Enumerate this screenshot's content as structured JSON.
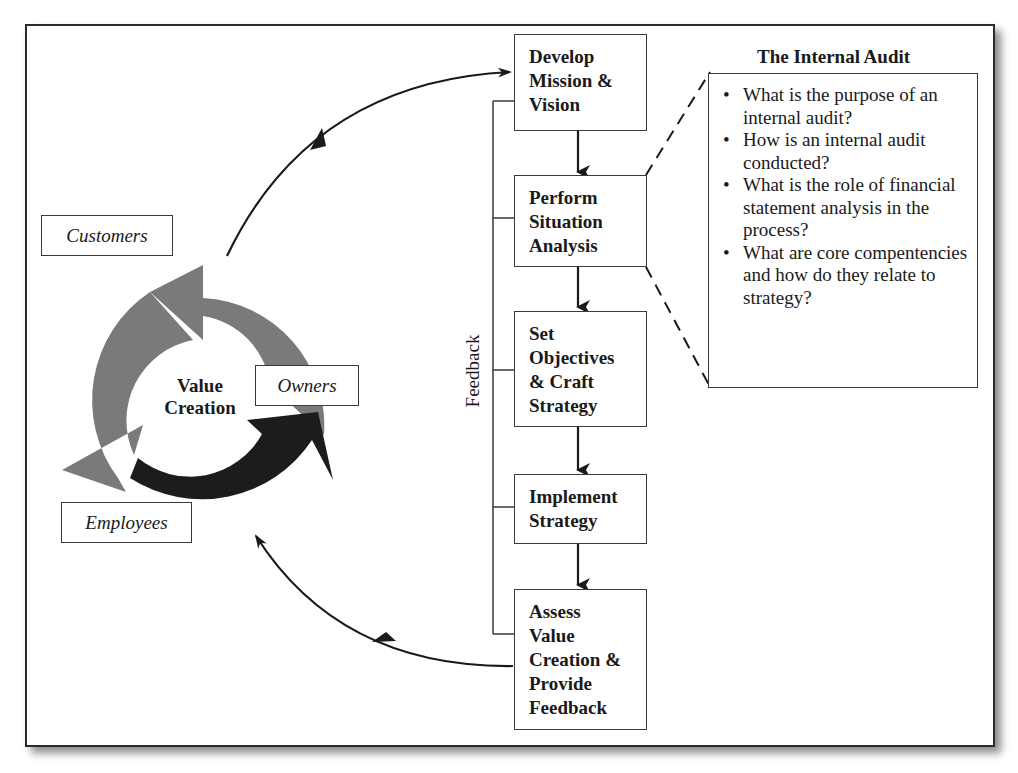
{
  "cycle": {
    "center_line1": "Value",
    "center_line2": "Creation",
    "labels": {
      "customers": "Customers",
      "owners": "Owners",
      "employees": "Employees"
    },
    "colors": {
      "light_arrow": "#7a7a7a",
      "dark_arrow": "#1c1c1c"
    }
  },
  "process": {
    "feedback_label": "Feedback",
    "steps": [
      {
        "lines": [
          "Develop",
          "Mission &",
          "Vision"
        ]
      },
      {
        "lines": [
          "Perform",
          "Situation",
          "Analysis"
        ]
      },
      {
        "lines": [
          "Set",
          "Objectives",
          "& Craft",
          "Strategy"
        ]
      },
      {
        "lines": [
          "Implement",
          "Strategy"
        ]
      },
      {
        "lines": [
          "Assess",
          "Value",
          "Creation &",
          "Provide",
          "Feedback"
        ]
      }
    ]
  },
  "audit": {
    "title": "The Internal Audit",
    "items": [
      "What is the purpose of an internal audit?",
      "How is an internal audit conducted?",
      "What is the role of financial statement analysis in the process?",
      "What are core compentencies and how do they relate to strategy?"
    ]
  }
}
